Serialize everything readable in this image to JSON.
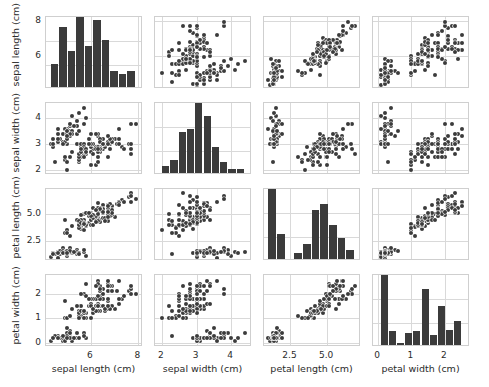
{
  "chart_data": {
    "type": "scatter",
    "title": "",
    "subtitle": "",
    "plot_kind": "scatter-plot-matrix",
    "grid": true,
    "legend": "none",
    "marker_color": "#3b3b3b",
    "bar_color": "#3b3b3b",
    "grid_color": "#d9d9d9",
    "frame_color": "#cfcfcf",
    "variables": [
      {
        "key": "sepal_length",
        "label": "sepal length (cm)",
        "lim": [
          4.1,
          8.2
        ],
        "ticks": [
          6,
          8
        ],
        "tick_labels": [
          "6",
          "8"
        ]
      },
      {
        "key": "sepal_width",
        "label": "sepal width (cm)",
        "lim": [
          1.8,
          4.6
        ],
        "ticks": [
          2,
          3,
          4
        ],
        "tick_labels": [
          "2",
          "3",
          "4"
        ]
      },
      {
        "key": "petal_length",
        "label": "petal length (cm)",
        "lim": [
          0.7,
          7.3
        ],
        "ticks": [
          2.5,
          5.0
        ],
        "tick_labels": [
          "2.5",
          "5.0"
        ]
      },
      {
        "key": "petal_width",
        "label": "petal width (cm)",
        "lim": [
          -0.15,
          2.75
        ],
        "ticks": [
          0,
          1,
          2
        ],
        "tick_labels": [
          "0",
          "1",
          "2"
        ]
      }
    ],
    "histograms": {
      "sepal_length": {
        "bin_edges": [
          4.3,
          4.66,
          5.02,
          5.38,
          5.74,
          6.1,
          6.46,
          6.82,
          7.18,
          7.54,
          7.9
        ],
        "counts": [
          9,
          23,
          14,
          27,
          16,
          26,
          18,
          6,
          5,
          6
        ]
      },
      "sepal_width": {
        "bin_edges": [
          2.0,
          2.24,
          2.48,
          2.72,
          2.96,
          3.2,
          3.44,
          3.68,
          3.92,
          4.16,
          4.4
        ],
        "counts": [
          4,
          7,
          22,
          24,
          38,
          31,
          14,
          6,
          2,
          2
        ]
      },
      "petal_length": {
        "bin_edges": [
          1.0,
          1.59,
          2.18,
          2.77,
          3.36,
          3.95,
          4.54,
          5.13,
          5.72,
          6.31,
          6.9
        ],
        "counts": [
          37,
          13,
          0,
          3,
          8,
          26,
          29,
          18,
          11,
          5
        ]
      },
      "petal_width": {
        "bin_edges": [
          0.1,
          0.34,
          0.58,
          0.82,
          1.06,
          1.3,
          1.54,
          1.78,
          2.02,
          2.26,
          2.5
        ],
        "counts": [
          41,
          8,
          1,
          7,
          8,
          33,
          6,
          23,
          9,
          14
        ]
      }
    },
    "points": [
      [
        5.1,
        3.5,
        1.4,
        0.2
      ],
      [
        4.9,
        3.0,
        1.4,
        0.2
      ],
      [
        4.7,
        3.2,
        1.3,
        0.2
      ],
      [
        4.6,
        3.1,
        1.5,
        0.2
      ],
      [
        5.0,
        3.6,
        1.4,
        0.2
      ],
      [
        5.4,
        3.9,
        1.7,
        0.4
      ],
      [
        4.6,
        3.4,
        1.4,
        0.3
      ],
      [
        5.0,
        3.4,
        1.5,
        0.2
      ],
      [
        4.4,
        2.9,
        1.4,
        0.2
      ],
      [
        4.9,
        3.1,
        1.5,
        0.1
      ],
      [
        5.4,
        3.7,
        1.5,
        0.2
      ],
      [
        4.8,
        3.4,
        1.6,
        0.2
      ],
      [
        4.8,
        3.0,
        1.4,
        0.1
      ],
      [
        4.3,
        3.0,
        1.1,
        0.1
      ],
      [
        5.8,
        4.0,
        1.2,
        0.2
      ],
      [
        5.7,
        4.4,
        1.5,
        0.4
      ],
      [
        5.4,
        3.9,
        1.3,
        0.4
      ],
      [
        5.1,
        3.5,
        1.4,
        0.3
      ],
      [
        5.7,
        3.8,
        1.7,
        0.3
      ],
      [
        5.1,
        3.8,
        1.5,
        0.3
      ],
      [
        5.4,
        3.4,
        1.7,
        0.2
      ],
      [
        5.1,
        3.7,
        1.5,
        0.4
      ],
      [
        4.6,
        3.6,
        1.0,
        0.2
      ],
      [
        5.1,
        3.3,
        1.7,
        0.5
      ],
      [
        4.8,
        3.4,
        1.9,
        0.2
      ],
      [
        5.0,
        3.0,
        1.6,
        0.2
      ],
      [
        5.0,
        3.4,
        1.6,
        0.4
      ],
      [
        5.2,
        3.5,
        1.5,
        0.2
      ],
      [
        5.2,
        3.4,
        1.4,
        0.2
      ],
      [
        4.7,
        3.2,
        1.6,
        0.2
      ],
      [
        4.8,
        3.1,
        1.6,
        0.2
      ],
      [
        5.4,
        3.4,
        1.5,
        0.4
      ],
      [
        5.2,
        4.1,
        1.5,
        0.1
      ],
      [
        5.5,
        4.2,
        1.4,
        0.2
      ],
      [
        4.9,
        3.1,
        1.5,
        0.2
      ],
      [
        5.0,
        3.2,
        1.2,
        0.2
      ],
      [
        5.5,
        3.5,
        1.3,
        0.2
      ],
      [
        4.9,
        3.6,
        1.4,
        0.1
      ],
      [
        4.4,
        3.0,
        1.3,
        0.2
      ],
      [
        5.1,
        3.4,
        1.5,
        0.2
      ],
      [
        5.0,
        3.5,
        1.3,
        0.3
      ],
      [
        4.5,
        2.3,
        1.3,
        0.3
      ],
      [
        4.4,
        3.2,
        1.3,
        0.2
      ],
      [
        5.0,
        3.5,
        1.6,
        0.6
      ],
      [
        5.1,
        3.8,
        1.9,
        0.4
      ],
      [
        4.8,
        3.0,
        1.4,
        0.3
      ],
      [
        5.1,
        3.8,
        1.6,
        0.2
      ],
      [
        4.6,
        3.2,
        1.4,
        0.2
      ],
      [
        5.3,
        3.7,
        1.5,
        0.2
      ],
      [
        5.0,
        3.3,
        1.4,
        0.2
      ],
      [
        7.0,
        3.2,
        4.7,
        1.4
      ],
      [
        6.4,
        3.2,
        4.5,
        1.5
      ],
      [
        6.9,
        3.1,
        4.9,
        1.5
      ],
      [
        5.5,
        2.3,
        4.0,
        1.3
      ],
      [
        6.5,
        2.8,
        4.6,
        1.5
      ],
      [
        5.7,
        2.8,
        4.5,
        1.3
      ],
      [
        6.3,
        3.3,
        4.7,
        1.6
      ],
      [
        4.9,
        2.4,
        3.3,
        1.0
      ],
      [
        6.6,
        2.9,
        4.6,
        1.3
      ],
      [
        5.2,
        2.7,
        3.9,
        1.4
      ],
      [
        5.0,
        2.0,
        3.5,
        1.0
      ],
      [
        5.9,
        3.0,
        4.2,
        1.5
      ],
      [
        6.0,
        2.2,
        4.0,
        1.0
      ],
      [
        6.1,
        2.9,
        4.7,
        1.4
      ],
      [
        5.6,
        2.9,
        3.6,
        1.3
      ],
      [
        6.7,
        3.1,
        4.4,
        1.4
      ],
      [
        5.6,
        3.0,
        4.5,
        1.5
      ],
      [
        5.8,
        2.7,
        4.1,
        1.0
      ],
      [
        6.2,
        2.2,
        4.5,
        1.5
      ],
      [
        5.6,
        2.5,
        3.9,
        1.1
      ],
      [
        5.9,
        3.2,
        4.8,
        1.8
      ],
      [
        6.1,
        2.8,
        4.0,
        1.3
      ],
      [
        6.3,
        2.5,
        4.9,
        1.5
      ],
      [
        6.1,
        2.8,
        4.7,
        1.2
      ],
      [
        6.4,
        2.9,
        4.3,
        1.3
      ],
      [
        6.6,
        3.0,
        4.4,
        1.4
      ],
      [
        6.8,
        2.8,
        4.8,
        1.4
      ],
      [
        6.7,
        3.0,
        5.0,
        1.7
      ],
      [
        6.0,
        2.9,
        4.5,
        1.5
      ],
      [
        5.7,
        2.6,
        3.5,
        1.0
      ],
      [
        5.5,
        2.4,
        3.8,
        1.1
      ],
      [
        5.5,
        2.4,
        3.7,
        1.0
      ],
      [
        5.8,
        2.7,
        3.9,
        1.2
      ],
      [
        6.0,
        2.7,
        5.1,
        1.6
      ],
      [
        5.4,
        3.0,
        4.5,
        1.5
      ],
      [
        6.0,
        3.4,
        4.5,
        1.6
      ],
      [
        6.7,
        3.1,
        4.7,
        1.5
      ],
      [
        6.3,
        2.3,
        4.4,
        1.3
      ],
      [
        5.6,
        3.0,
        4.1,
        1.3
      ],
      [
        5.5,
        2.5,
        4.0,
        1.3
      ],
      [
        5.5,
        2.6,
        4.4,
        1.2
      ],
      [
        6.1,
        3.0,
        4.6,
        1.4
      ],
      [
        5.8,
        2.6,
        4.0,
        1.2
      ],
      [
        5.0,
        2.3,
        3.3,
        1.0
      ],
      [
        5.6,
        2.7,
        4.2,
        1.3
      ],
      [
        5.7,
        3.0,
        4.2,
        1.2
      ],
      [
        5.7,
        2.9,
        4.2,
        1.3
      ],
      [
        6.2,
        2.9,
        4.3,
        1.3
      ],
      [
        5.1,
        2.5,
        3.0,
        1.1
      ],
      [
        5.7,
        2.8,
        4.1,
        1.3
      ],
      [
        6.3,
        3.3,
        6.0,
        2.5
      ],
      [
        5.8,
        2.7,
        5.1,
        1.9
      ],
      [
        7.1,
        3.0,
        5.9,
        2.1
      ],
      [
        6.3,
        2.9,
        5.6,
        1.8
      ],
      [
        6.5,
        3.0,
        5.8,
        2.2
      ],
      [
        7.6,
        3.0,
        6.6,
        2.1
      ],
      [
        4.9,
        2.5,
        4.5,
        1.7
      ],
      [
        7.3,
        2.9,
        6.3,
        1.8
      ],
      [
        6.7,
        2.5,
        5.8,
        1.8
      ],
      [
        7.2,
        3.6,
        6.1,
        2.5
      ],
      [
        6.5,
        3.2,
        5.1,
        2.0
      ],
      [
        6.4,
        2.7,
        5.3,
        1.9
      ],
      [
        6.8,
        3.0,
        5.5,
        2.1
      ],
      [
        5.7,
        2.5,
        5.0,
        2.0
      ],
      [
        5.8,
        2.8,
        5.1,
        2.4
      ],
      [
        6.4,
        3.2,
        5.3,
        2.3
      ],
      [
        6.5,
        3.0,
        5.5,
        1.8
      ],
      [
        7.7,
        3.8,
        6.7,
        2.2
      ],
      [
        7.7,
        2.6,
        6.9,
        2.3
      ],
      [
        6.0,
        2.2,
        5.0,
        1.5
      ],
      [
        6.9,
        3.2,
        5.7,
        2.3
      ],
      [
        5.6,
        2.8,
        4.9,
        2.0
      ],
      [
        7.7,
        2.8,
        6.7,
        2.0
      ],
      [
        6.3,
        2.7,
        4.9,
        1.8
      ],
      [
        6.7,
        3.3,
        5.7,
        2.1
      ],
      [
        7.2,
        3.2,
        6.0,
        1.8
      ],
      [
        6.2,
        2.8,
        4.8,
        1.8
      ],
      [
        6.1,
        3.0,
        4.9,
        1.8
      ],
      [
        6.4,
        2.8,
        5.6,
        2.1
      ],
      [
        7.2,
        3.0,
        5.8,
        1.6
      ],
      [
        7.4,
        2.8,
        6.1,
        1.9
      ],
      [
        7.9,
        3.8,
        6.4,
        2.0
      ],
      [
        6.4,
        2.8,
        5.6,
        2.2
      ],
      [
        6.3,
        2.8,
        5.1,
        1.5
      ],
      [
        6.1,
        2.6,
        5.6,
        1.4
      ],
      [
        7.7,
        3.0,
        6.1,
        2.3
      ],
      [
        6.3,
        3.4,
        5.6,
        2.4
      ],
      [
        6.4,
        3.1,
        5.5,
        1.8
      ],
      [
        6.0,
        3.0,
        4.8,
        1.8
      ],
      [
        6.9,
        3.1,
        5.4,
        2.1
      ],
      [
        6.7,
        3.1,
        5.6,
        2.4
      ],
      [
        6.9,
        3.1,
        5.1,
        2.3
      ],
      [
        5.8,
        2.7,
        5.1,
        1.9
      ],
      [
        6.8,
        3.2,
        5.9,
        2.3
      ],
      [
        6.7,
        3.3,
        5.7,
        2.5
      ],
      [
        6.7,
        3.0,
        5.2,
        2.3
      ],
      [
        6.3,
        2.5,
        5.0,
        1.9
      ],
      [
        6.5,
        3.0,
        5.2,
        2.0
      ],
      [
        6.2,
        3.4,
        5.4,
        2.3
      ],
      [
        5.9,
        3.0,
        5.1,
        1.8
      ]
    ]
  }
}
